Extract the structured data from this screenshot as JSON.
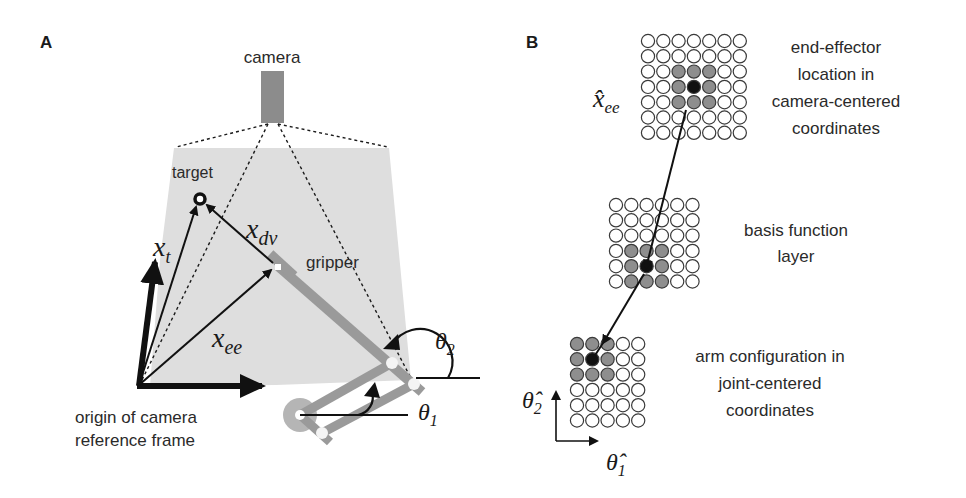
{
  "panels": {
    "a": {
      "label": "A",
      "camera_label": "camera",
      "target_label": "target",
      "gripper_label": "gripper",
      "origin_label_line1": "origin of camera",
      "origin_label_line2": "reference frame",
      "vectors": {
        "x_t": {
          "base": "x",
          "sub": "t"
        },
        "x_dv": {
          "base": "x",
          "sub": "dv"
        },
        "x_ee": {
          "base": "x",
          "sub": "ee"
        }
      },
      "angles": {
        "theta1": {
          "base": "θ",
          "sub": "1"
        },
        "theta2": {
          "base": "θ",
          "sub": "2"
        }
      }
    },
    "b": {
      "label": "B",
      "top_layer": {
        "symbol_base": "x̂",
        "symbol_sub": "ee",
        "desc_line1": "end-effector",
        "desc_line2": "location in",
        "desc_line3": "camera-centered",
        "desc_line4": "coordinates",
        "grid": {
          "cols": 7,
          "rows": 7,
          "active": [
            [
              2,
              2
            ],
            [
              2,
              3
            ],
            [
              2,
              4
            ],
            [
              3,
              2
            ],
            [
              3,
              4
            ],
            [
              4,
              2
            ],
            [
              4,
              3
            ],
            [
              4,
              4
            ]
          ],
          "peak": [
            3,
            3
          ]
        }
      },
      "middle_layer": {
        "desc_line1": "basis function",
        "desc_line2": "layer",
        "grid": {
          "cols": 6,
          "rows": 6,
          "active": [
            [
              3,
              1
            ],
            [
              3,
              2
            ],
            [
              3,
              3
            ],
            [
              4,
              1
            ],
            [
              4,
              3
            ],
            [
              5,
              1
            ],
            [
              5,
              2
            ],
            [
              5,
              3
            ]
          ],
          "peak": [
            4,
            2
          ]
        }
      },
      "bottom_layer": {
        "desc_line1": "arm configuration in",
        "desc_line2": "joint-centered",
        "desc_line3": "coordinates",
        "axis_y": {
          "base": "θ̂",
          "sub": "2"
        },
        "axis_x": {
          "base": "θ̂",
          "sub": "1"
        },
        "grid": {
          "cols": 5,
          "rows": 6,
          "active": [
            [
              0,
              0
            ],
            [
              0,
              1
            ],
            [
              0,
              2
            ],
            [
              1,
              0
            ],
            [
              1,
              2
            ],
            [
              2,
              0
            ],
            [
              2,
              1
            ],
            [
              2,
              2
            ]
          ],
          "peak": [
            1,
            1
          ]
        }
      }
    }
  },
  "colors": {
    "field_of_view": "#dcdcdc",
    "arm": "#9a9a9a",
    "camera": "#8c8c8c",
    "active_unit": "#8e8e8e",
    "peak_unit": "#111111",
    "stroke": "#1a1a1a"
  }
}
